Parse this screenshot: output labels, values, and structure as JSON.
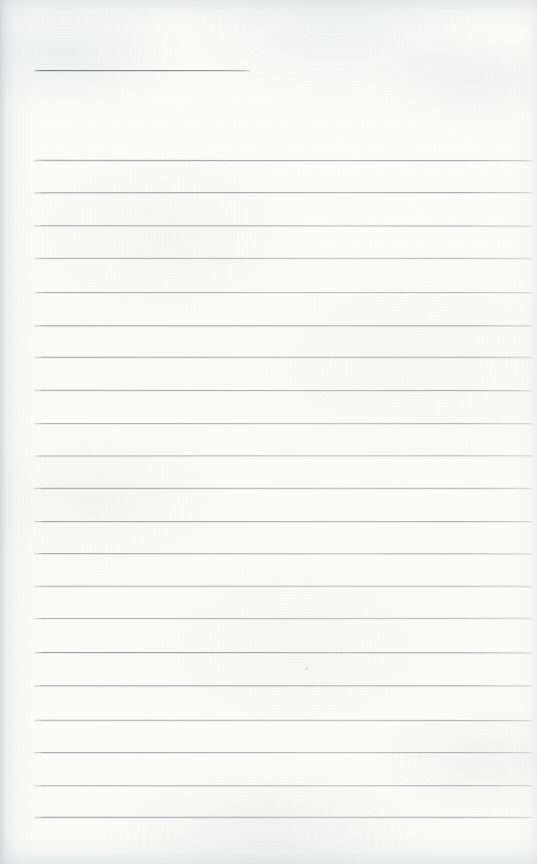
{
  "document": {
    "kind": "scanned-lined-notebook-page",
    "title": "",
    "page_width": 537,
    "page_height": 864,
    "written_content": "",
    "is_blank": true,
    "visible_text_items": []
  },
  "paper": {
    "background_color": "#fbfbfa",
    "edge_shadow_color": "#cbced1",
    "texture_note": "mottled off-white scan with soft grain and darker left/top/bottom edges"
  },
  "ruling": {
    "line_color": "#969ba0",
    "line_thickness_px": 1,
    "left_margin_x": 34,
    "right_margin_x": 533,
    "line_spacing_px": 32.85,
    "title_rule": {
      "label": "heading-rule",
      "x": 34,
      "y": 70,
      "width": 216
    },
    "body_rules": [
      {
        "index": 1,
        "y": 160,
        "x": 34,
        "width": 499
      },
      {
        "index": 2,
        "y": 192,
        "x": 34,
        "width": 499
      },
      {
        "index": 3,
        "y": 225,
        "x": 34,
        "width": 499
      },
      {
        "index": 4,
        "y": 258,
        "x": 34,
        "width": 499
      },
      {
        "index": 5,
        "y": 292,
        "x": 34,
        "width": 499
      },
      {
        "index": 6,
        "y": 325,
        "x": 34,
        "width": 499
      },
      {
        "index": 7,
        "y": 357,
        "x": 34,
        "width": 499
      },
      {
        "index": 8,
        "y": 390,
        "x": 34,
        "width": 499
      },
      {
        "index": 9,
        "y": 423,
        "x": 34,
        "width": 499
      },
      {
        "index": 10,
        "y": 455,
        "x": 34,
        "width": 499
      },
      {
        "index": 11,
        "y": 488,
        "x": 34,
        "width": 499
      },
      {
        "index": 12,
        "y": 521,
        "x": 34,
        "width": 499
      },
      {
        "index": 13,
        "y": 553,
        "x": 34,
        "width": 499
      },
      {
        "index": 14,
        "y": 586,
        "x": 34,
        "width": 499
      },
      {
        "index": 15,
        "y": 618,
        "x": 34,
        "width": 499
      },
      {
        "index": 16,
        "y": 652,
        "x": 34,
        "width": 499
      },
      {
        "index": 17,
        "y": 685,
        "x": 34,
        "width": 499
      },
      {
        "index": 18,
        "y": 720,
        "x": 34,
        "width": 499
      },
      {
        "index": 19,
        "y": 752,
        "x": 34,
        "width": 499
      },
      {
        "index": 20,
        "y": 785,
        "x": 34,
        "width": 499
      },
      {
        "index": 21,
        "y": 817,
        "x": 34,
        "width": 499
      }
    ],
    "line_count": 21
  },
  "artifacts": {
    "specks": [
      {
        "label": "scan-speck",
        "x": 305,
        "y": 667,
        "size": 3
      }
    ]
  }
}
